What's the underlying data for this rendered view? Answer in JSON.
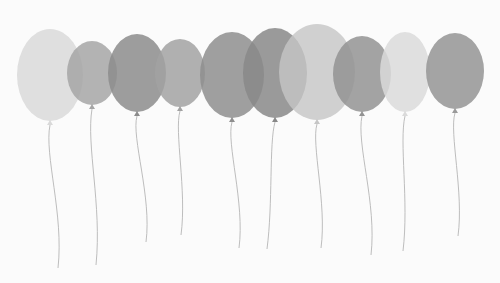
{
  "scene": {
    "description": "Row of ten grayscale balloons with strings on a white background",
    "background": "#fbfbfb",
    "string_color": "#b5b5b5",
    "balloons": [
      {
        "cx": 50,
        "cy": 75,
        "rx": 33,
        "ry": 46,
        "fill": "#d9d9d9",
        "opacity": 0.85,
        "string_end": [
          58,
          268
        ]
      },
      {
        "cx": 92,
        "cy": 73,
        "rx": 25,
        "ry": 32,
        "fill": "#a6a6a6",
        "opacity": 0.85,
        "string_end": [
          96,
          265
        ]
      },
      {
        "cx": 137,
        "cy": 73,
        "rx": 29,
        "ry": 39,
        "fill": "#8c8c8c",
        "opacity": 0.85,
        "string_end": [
          146,
          242
        ]
      },
      {
        "cx": 180,
        "cy": 73,
        "rx": 25,
        "ry": 34,
        "fill": "#a2a2a2",
        "opacity": 0.85,
        "string_end": [
          181,
          235
        ]
      },
      {
        "cx": 232,
        "cy": 75,
        "rx": 32,
        "ry": 43,
        "fill": "#8e8e8e",
        "opacity": 0.85,
        "string_end": [
          239,
          248
        ]
      },
      {
        "cx": 275,
        "cy": 73,
        "rx": 32,
        "ry": 45,
        "fill": "#888888",
        "opacity": 0.85,
        "string_end": [
          267,
          249
        ]
      },
      {
        "cx": 317,
        "cy": 72,
        "rx": 38,
        "ry": 48,
        "fill": "#c6c6c6",
        "opacity": 0.8,
        "string_end": [
          321,
          248
        ]
      },
      {
        "cx": 362,
        "cy": 74,
        "rx": 29,
        "ry": 38,
        "fill": "#939393",
        "opacity": 0.85,
        "string_end": [
          371,
          255
        ]
      },
      {
        "cx": 405,
        "cy": 72,
        "rx": 25,
        "ry": 40,
        "fill": "#dadada",
        "opacity": 0.85,
        "string_end": [
          403,
          251
        ]
      },
      {
        "cx": 455,
        "cy": 71,
        "rx": 29,
        "ry": 38,
        "fill": "#9a9a9a",
        "opacity": 0.9,
        "string_end": [
          458,
          236
        ]
      }
    ]
  }
}
